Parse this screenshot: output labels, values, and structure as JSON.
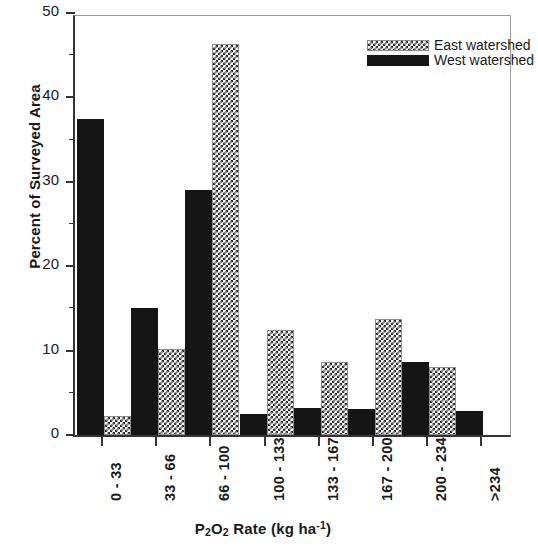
{
  "chart_data": {
    "type": "bar",
    "title": "",
    "xlabel": "P2O2 Rate (kg ha-1)",
    "xlabel_parts": {
      "p": "P",
      "sub1": "2",
      "o": "O",
      "sub2": "2",
      "rate": " Rate (kg ha",
      "sup": "-1",
      "close": ")"
    },
    "ylabel": "Percent of Surveyed Area",
    "ylim": [
      0,
      50
    ],
    "ytick_major": [
      0,
      10,
      20,
      30,
      40,
      50
    ],
    "ytick_minor": [
      5,
      15,
      25,
      35,
      45
    ],
    "ytick_labels": [
      "0",
      "10",
      "20",
      "30",
      "40",
      "50"
    ],
    "grid": false,
    "legend_position": "top-right",
    "categories": [
      "0 - 33",
      "33 - 66",
      "66 - 100",
      "100 - 133",
      "133 - 167",
      "167 - 200",
      "200 - 234",
      ">234"
    ],
    "series": [
      {
        "name": "East watershed",
        "pattern": "crosshatch",
        "color": "#2b2b2b",
        "values": [
          2.3,
          10.2,
          46.3,
          12.5,
          8.7,
          13.7,
          8.0,
          null
        ]
      },
      {
        "name": "West watershed",
        "pattern": "solid",
        "color": "#151515",
        "values": [
          37.5,
          15.0,
          29.0,
          2.5,
          3.2,
          3.1,
          8.6,
          2.9
        ]
      }
    ]
  },
  "legend": {
    "items": [
      {
        "label": "East watershed",
        "style": "east"
      },
      {
        "label": "West watershed",
        "style": "west"
      }
    ]
  },
  "axes": {
    "y_title": "Percent of Surveyed Area",
    "x_title_plain": "P2O2 Rate (kg ha-1)"
  }
}
